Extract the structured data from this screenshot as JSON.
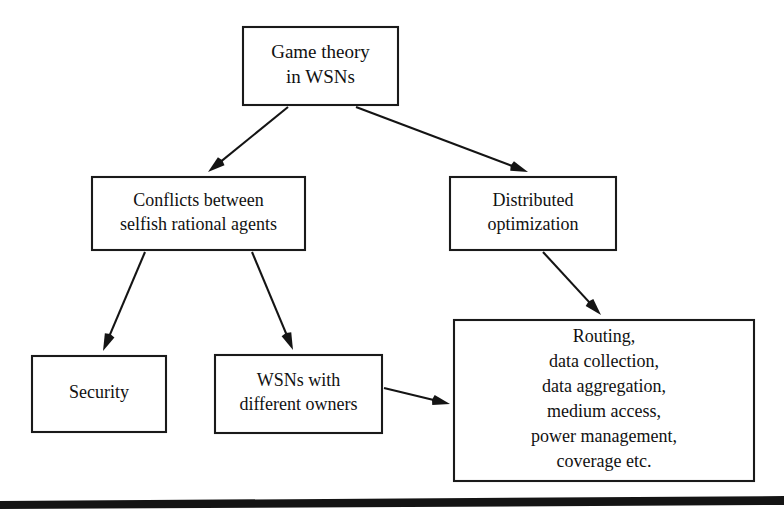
{
  "figure": {
    "kind": "flowchart",
    "background_color": "#ffffff",
    "line_color": "#141414",
    "box_fill": "#ffffff",
    "text_color": "#111111",
    "footer_rule_color": "#141414"
  },
  "nodes": [
    {
      "id": "root",
      "name": "game-theory-in-wsns",
      "lines": [
        "Game theory",
        "in WSNs"
      ],
      "x": 243,
      "y": 27,
      "width": 155,
      "height": 78,
      "font_size": 19,
      "line_height": 25
    },
    {
      "id": "conflicts",
      "name": "conflicts-between-selfish-rational-agents",
      "lines": [
        "Conflicts between",
        "selfish rational agents"
      ],
      "x": 92,
      "y": 177,
      "width": 213,
      "height": 73,
      "font_size": 18,
      "line_height": 24
    },
    {
      "id": "distributed",
      "name": "distributed-optimization",
      "lines": [
        "Distributed",
        "optimization"
      ],
      "x": 450,
      "y": 177,
      "width": 166,
      "height": 73,
      "font_size": 18,
      "line_height": 24
    },
    {
      "id": "security",
      "name": "security",
      "lines": [
        "Security"
      ],
      "x": 32,
      "y": 356,
      "width": 134,
      "height": 76,
      "font_size": 18,
      "line_height": 24
    },
    {
      "id": "owners",
      "name": "wsns-with-different-owners",
      "lines": [
        "WSNs with",
        "different owners"
      ],
      "x": 215,
      "y": 355,
      "width": 167,
      "height": 78,
      "font_size": 18,
      "line_height": 24
    },
    {
      "id": "applications",
      "name": "routing-data-collection-applications",
      "lines": [
        "Routing,",
        "data collection,",
        "data aggregation,",
        "medium access,",
        "power management,",
        "coverage etc."
      ],
      "x": 454,
      "y": 320,
      "width": 300,
      "height": 161,
      "font_size": 18,
      "line_height": 25
    }
  ],
  "edges": [
    {
      "name": "edge-root-to-conflicts",
      "from": "root",
      "to": "conflicts",
      "x1": 288,
      "y1": 107,
      "x2": 208,
      "y2": 172,
      "head_angle_deg": 39
    },
    {
      "name": "edge-root-to-distributed",
      "from": "root",
      "to": "distributed",
      "x1": 356,
      "y1": 107,
      "x2": 528,
      "y2": 172,
      "head_angle_deg": 21
    },
    {
      "name": "edge-conflicts-to-security",
      "from": "conflicts",
      "to": "security",
      "x1": 145,
      "y1": 252,
      "x2": 103,
      "y2": 351,
      "head_angle_deg": 67
    },
    {
      "name": "edge-conflicts-to-owners",
      "from": "conflicts",
      "to": "owners",
      "x1": 252,
      "y1": 252,
      "x2": 293,
      "y2": 350,
      "head_angle_deg": 67
    },
    {
      "name": "edge-distributed-to-applications",
      "from": "distributed",
      "to": "applications",
      "x1": 543,
      "y1": 252,
      "x2": 601,
      "y2": 315,
      "head_angle_deg": 47
    },
    {
      "name": "edge-owners-to-applications",
      "from": "owners",
      "to": "applications",
      "x1": 384,
      "y1": 388,
      "x2": 450,
      "y2": 404,
      "head_angle_deg": 14
    }
  ],
  "footer_rule": {
    "name": "page-footer-rule",
    "points": "0,501 784,496 784,505 0,509",
    "visible": true
  }
}
